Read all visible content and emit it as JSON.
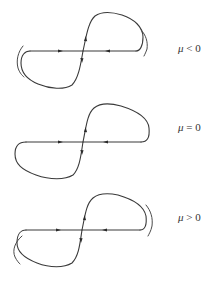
{
  "figure": {
    "type": "phase portrait of homoclinic figure-eight bifurcation",
    "stroke_color": "#3a3a3a",
    "background": "#ffffff"
  },
  "panels": [
    {
      "id": "mu-negative",
      "label": {
        "symbol": "μ",
        "relation": "<",
        "value": "0"
      },
      "outer_orbits": "two separate outer arcs (left and right), broken homoclinic loop"
    },
    {
      "id": "mu-zero",
      "label": {
        "symbol": "μ",
        "relation": "=",
        "value": "0"
      },
      "outer_orbits": "none, closed double homoclinic loop (figure eight)"
    },
    {
      "id": "mu-positive",
      "label": {
        "symbol": "μ",
        "relation": ">",
        "value": "0"
      },
      "outer_orbits": "outer arcs enclosing loops on both sides"
    }
  ]
}
